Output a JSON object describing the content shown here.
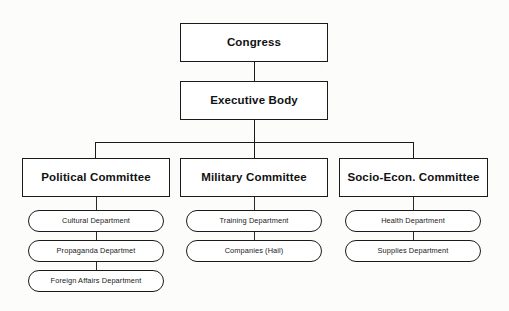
{
  "diagram": {
    "type": "organizational-chart",
    "colors": {
      "background": "#fcfcfb",
      "box_fill": "#ffffff",
      "line": "#1b1b1b",
      "text": "#111111"
    },
    "levels": {
      "level1": {
        "congress": {
          "label": "Congress"
        }
      },
      "level2": {
        "executive_body": {
          "label": "Executive Body"
        }
      },
      "level3": {
        "political_committee": {
          "label": "Political Committee"
        },
        "military_committee": {
          "label": "Military Committee"
        },
        "socio_econ_committee": {
          "label": "Socio-Econ. Committee"
        }
      },
      "level4": {
        "political_departments": [
          {
            "label": "Cultural Department"
          },
          {
            "label": "Propaganda Departmet"
          },
          {
            "label": "Foreign Affairs Department"
          }
        ],
        "military_departments": [
          {
            "label": "Training Department"
          },
          {
            "label": "Companies (Hail)"
          }
        ],
        "socio_econ_departments": [
          {
            "label": "Health Department"
          },
          {
            "label": "Supplies Department"
          }
        ]
      }
    }
  }
}
